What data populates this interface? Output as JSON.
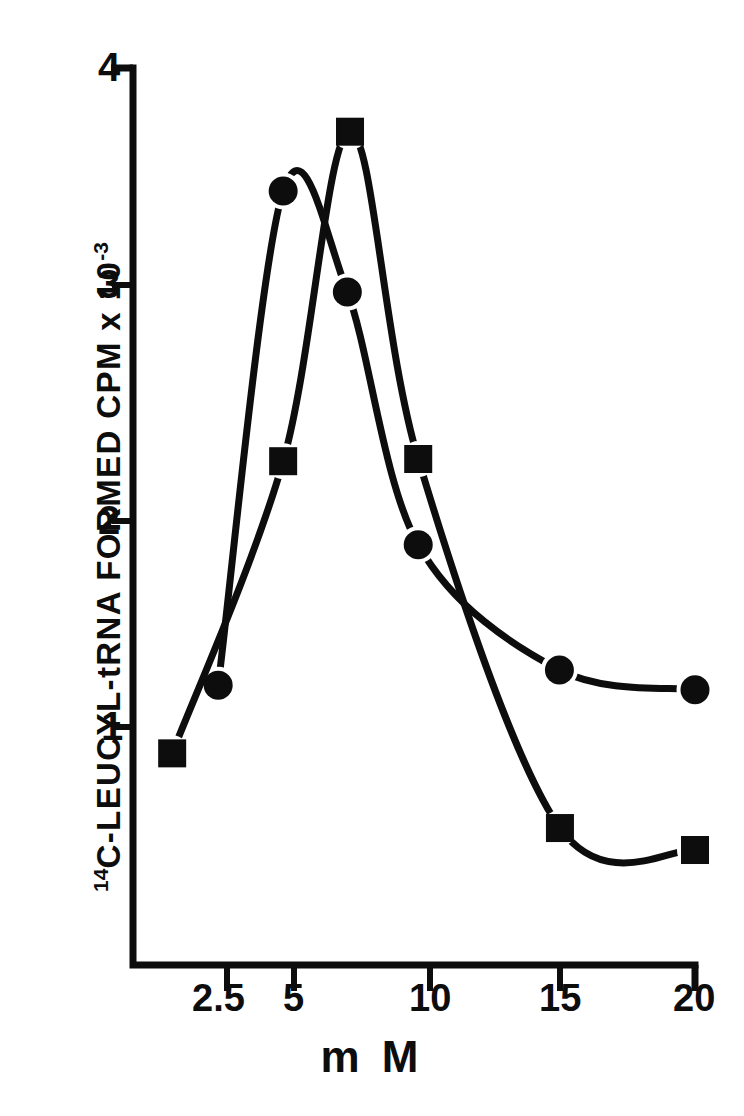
{
  "chart_data": {
    "type": "line",
    "title": "",
    "subtitle": "",
    "xlabel": "m M",
    "ylabel_prefix": "14",
    "ylabel": "C-LEUCYL-tRNA FORMED   CPM x 10",
    "ylabel_exponent": "-3",
    "xlim": [
      0,
      20.8
    ],
    "ylim": [
      0,
      4.13
    ],
    "x_ticks": [
      2.5,
      5,
      10,
      15,
      20
    ],
    "x_tick_labels": [
      "2.5",
      "5",
      "10",
      "15",
      "20"
    ],
    "y_ticks": [
      1,
      2,
      3,
      4
    ],
    "y_tick_labels": [
      "1",
      "2",
      "3",
      "4"
    ],
    "grid": false,
    "legend": "none",
    "axis_style": "left-and-bottom-spine-with-outward-ticks",
    "line_color": "#0d0d0d",
    "marker_color": "#0d0d0d",
    "series": [
      {
        "name": "circle-series",
        "marker": "circle",
        "x": [
          2.17,
          4.6,
          7.0,
          9.65,
          14.93,
          20.0
        ],
        "values": [
          1.19,
          3.44,
          2.98,
          1.83,
          1.26,
          1.17
        ]
      },
      {
        "name": "square-series",
        "marker": "square",
        "x": [
          0.45,
          4.6,
          7.1,
          9.65,
          14.95,
          20.0
        ],
        "values": [
          0.88,
          2.21,
          3.71,
          2.22,
          0.54,
          0.44
        ]
      }
    ]
  },
  "axes": {
    "x_tick_labels": [
      "2.5",
      "5",
      "10",
      "15",
      "20"
    ],
    "y_tick_labels": [
      "4",
      "3",
      "2",
      "1"
    ],
    "x_axis_title": "m M"
  }
}
